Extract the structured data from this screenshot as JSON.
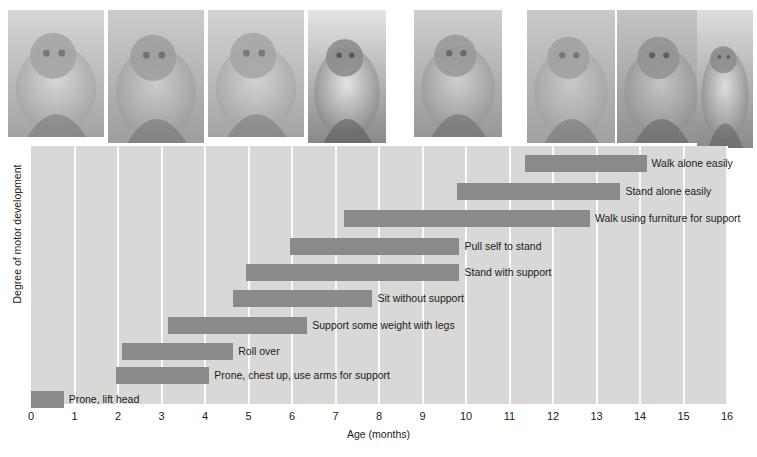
{
  "figure": {
    "caption_present": false
  },
  "photos": {
    "alt_strip_name": "infant-motor-development-photo-strip",
    "items": [
      {
        "name": "photo-prone-lift-head",
        "caption": ""
      },
      {
        "name": "photo-roll-over",
        "caption": ""
      },
      {
        "name": "photo-support-weight-legs",
        "caption": ""
      },
      {
        "name": "photo-sit-without-support",
        "caption": ""
      },
      {
        "name": "photo-pull-self-to-stand",
        "caption": ""
      },
      {
        "name": "photo-stand-with-support",
        "caption": ""
      },
      {
        "name": "photo-walk-with-help",
        "caption": ""
      },
      {
        "name": "photo-walk-alone",
        "caption": ""
      }
    ]
  },
  "chart_data": {
    "type": "bar",
    "orientation": "horizontal",
    "subtype": "range-bar",
    "title": "",
    "xlabel": "Age (months)",
    "ylabel": "Degree of motor development",
    "xlim": [
      0,
      16
    ],
    "ylim": [
      0,
      10
    ],
    "grid": true,
    "grid_axis": "x",
    "legend": "none",
    "colors": {
      "bar": "#8a8a8a",
      "plot_background": "#d8d8d6",
      "gridline": "#fbfbfa",
      "text": "#1b1b1b"
    },
    "xticks": [
      "0",
      "1",
      "2",
      "3",
      "4",
      "5",
      "6",
      "7",
      "8",
      "9",
      "10",
      "11",
      "12",
      "13",
      "14",
      "15",
      "16"
    ],
    "categories": [
      "Walk alone easily",
      "Stand alone easily",
      "Walk using furniture for support",
      "Pull self to stand",
      "Stand with support",
      "Sit without support",
      "Support some weight with legs",
      "Roll over",
      "Prone, chest up, use arms for support",
      "Prone, lift head"
    ],
    "bars": [
      {
        "label": "Walk alone easily",
        "start": 11.35,
        "end": 14.15,
        "row": 0
      },
      {
        "label": "Stand alone easily",
        "start": 9.8,
        "end": 13.55,
        "row": 1
      },
      {
        "label": "Walk using furniture for support",
        "start": 7.2,
        "end": 12.85,
        "row": 2
      },
      {
        "label": "Pull self to stand",
        "start": 5.95,
        "end": 9.85,
        "row": 3
      },
      {
        "label": "Stand with support",
        "start": 4.95,
        "end": 9.85,
        "row": 4
      },
      {
        "label": "Sit without support",
        "start": 4.65,
        "end": 7.85,
        "row": 5
      },
      {
        "label": "Support some weight with legs",
        "start": 3.15,
        "end": 6.35,
        "row": 6
      },
      {
        "label": "Roll over",
        "start": 2.1,
        "end": 4.65,
        "row": 7
      },
      {
        "label": "Prone, chest up, use arms for support",
        "start": 1.95,
        "end": 4.1,
        "row": 8
      },
      {
        "label": "Prone, lift head",
        "start": 0.0,
        "end": 0.75,
        "row": 9
      }
    ]
  }
}
